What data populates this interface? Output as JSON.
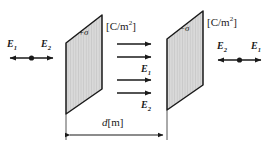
{
  "figure": {
    "background_color": "#ffffff",
    "plate_fill_color": "#d9d9d9",
    "plate_stroke_color": "#1a1a1a",
    "arrow_color": "#1a1a1a",
    "text_color": "#1a1a1a"
  },
  "left_plate": {
    "charge_label": "+σ",
    "unit_label": "[C/m",
    "unit_exponent": "2",
    "unit_close": "]"
  },
  "right_plate": {
    "charge_label": "−σ",
    "unit_label": "[C/m",
    "unit_exponent": "2",
    "unit_close": "]"
  },
  "left_region": {
    "left_field_label": "E",
    "left_field_sub": "1",
    "right_field_label": "E",
    "right_field_sub": "2",
    "point_marker": "dot"
  },
  "right_region": {
    "left_field_label": "E",
    "left_field_sub": "2",
    "right_field_label": "E",
    "right_field_sub": "1",
    "point_marker": "dot"
  },
  "middle_region": {
    "arrow_count": 4,
    "field_label_1": "E",
    "field_sub_1": "1",
    "field_label_2": "E",
    "field_sub_2": "2",
    "direction": "right"
  },
  "dimension": {
    "label_symbol": "d",
    "label_unit": "[m]",
    "arrow_style": "double-headed"
  }
}
